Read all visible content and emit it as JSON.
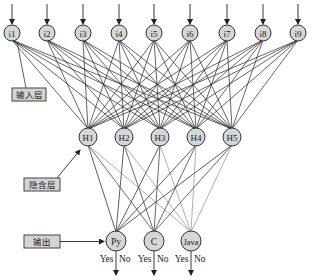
{
  "diagram": {
    "title": "",
    "colors": {
      "node_fill": "#d6d6d6",
      "node_stroke": "#333333",
      "edge_dark": "#222222",
      "edge_light": "#9a9a9a",
      "label_box_fill": "#d4d4d4"
    },
    "input_layer": {
      "label": "输入层",
      "nodes": [
        "i1",
        "i2",
        "i3",
        "i4",
        "i5",
        "i6",
        "i7",
        "i8",
        "i9"
      ]
    },
    "hidden_layer": {
      "label": "隐含层",
      "nodes": [
        "H1",
        "H2",
        "H3",
        "H4",
        "H5"
      ]
    },
    "output_layer": {
      "label": "输出",
      "nodes": [
        {
          "name": "Py",
          "yes": "Yes",
          "no": "No"
        },
        {
          "name": "C",
          "yes": "Yes",
          "no": "No"
        },
        {
          "name": "Java",
          "yes": "Yes",
          "no": "No"
        }
      ]
    },
    "connections": "fully connected between adjacent layers"
  }
}
